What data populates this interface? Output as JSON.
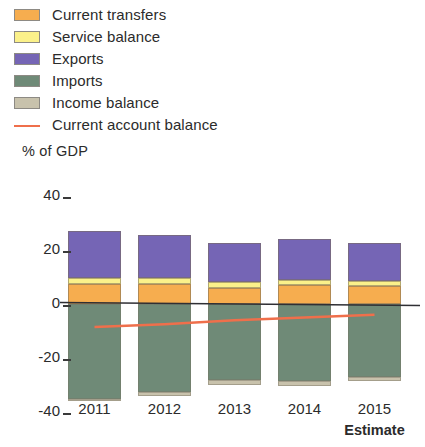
{
  "legend": {
    "items": [
      {
        "label": "Current transfers",
        "color": "#f6ad4f",
        "kind": "swatch",
        "name": "legend-swatch-current-transfers"
      },
      {
        "label": "Service balance",
        "color": "#fbf18a",
        "kind": "swatch",
        "name": "legend-swatch-service-balance"
      },
      {
        "label": "Exports",
        "color": "#7565b5",
        "kind": "swatch",
        "name": "legend-swatch-exports"
      },
      {
        "label": "Imports",
        "color": "#6f8a77",
        "kind": "swatch",
        "name": "legend-swatch-imports"
      },
      {
        "label": "Income balance",
        "color": "#c8c2ac",
        "kind": "swatch",
        "name": "legend-swatch-income-balance"
      },
      {
        "label": "Current account balance",
        "color": "#ef6f4b",
        "kind": "line",
        "name": "legend-line-current-account-balance"
      }
    ]
  },
  "axis": {
    "y_title": "% of GDP",
    "y_ticks": [
      "40",
      "20",
      "0",
      "-20",
      "-40"
    ],
    "x_labels": [
      "2011",
      "2012",
      "2013",
      "2014",
      "2015"
    ],
    "x_note": "Estimate"
  },
  "chart_data": {
    "type": "bar",
    "title": "",
    "subtitle": "",
    "xlabel": "",
    "ylabel": "% of GDP",
    "ylim": [
      -40,
      40
    ],
    "grid": false,
    "legend_position": "top-left",
    "stacked": true,
    "categories": [
      "2011",
      "2012",
      "2013",
      "2014",
      "2015"
    ],
    "category_notes": {
      "2015": "Estimate"
    },
    "series": [
      {
        "name": "Current transfers",
        "color": "#f6ad4f",
        "values": [
          7.5,
          7.5,
          6.0,
          7.0,
          6.5
        ]
      },
      {
        "name": "Service balance",
        "color": "#fbf18a",
        "values": [
          2.0,
          2.0,
          2.0,
          2.0,
          2.0
        ]
      },
      {
        "name": "Exports",
        "color": "#7565b5",
        "values": [
          17.5,
          16.0,
          14.5,
          15.0,
          14.0
        ]
      },
      {
        "name": "Imports",
        "color": "#6f8a77",
        "values": [
          -35.0,
          -32.5,
          -28.0,
          -28.5,
          -27.0
        ]
      },
      {
        "name": "Income balance",
        "color": "#c8c2ac",
        "values": [
          -0.5,
          -1.5,
          -2.0,
          -2.0,
          -1.5
        ]
      }
    ],
    "line_series": {
      "name": "Current account balance",
      "color": "#ef6f4b",
      "values": [
        -8.5,
        -7.5,
        -6.0,
        -5.0,
        -4.0
      ]
    }
  }
}
